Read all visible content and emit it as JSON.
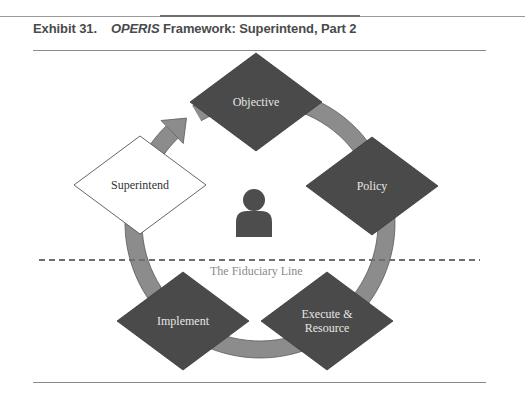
{
  "exhibit": {
    "number": "Exhibit 31.",
    "framework_name": "OPERIS",
    "title_rest": " Framework: Superintend, Part 2"
  },
  "diagram": {
    "nodes": [
      {
        "id": "objective",
        "label_lines": [
          "Objective"
        ],
        "style": "dark"
      },
      {
        "id": "policy",
        "label_lines": [
          "Policy"
        ],
        "style": "dark"
      },
      {
        "id": "execute",
        "label_lines": [
          "Execute &",
          "Resource"
        ],
        "style": "dark"
      },
      {
        "id": "implement",
        "label_lines": [
          "Implement"
        ],
        "style": "dark"
      },
      {
        "id": "superintend",
        "label_lines": [
          "Superintend"
        ],
        "style": "light"
      }
    ],
    "fiduciary_line_label": "The Fiduciary Line",
    "center_icon": "person-icon",
    "cycle_direction": "clockwise",
    "colors": {
      "dark_node": "#4a4a4a",
      "light_node": "#ffffff",
      "ring": "#8c8c8c",
      "ring_edge": "#5a5a5a",
      "dashed_line": "#6e6e6e",
      "dark_label": "#e6e6e6",
      "light_label": "#333333",
      "fiduciary_label": "#8a8a8a",
      "person": "#4d4d4d"
    }
  }
}
